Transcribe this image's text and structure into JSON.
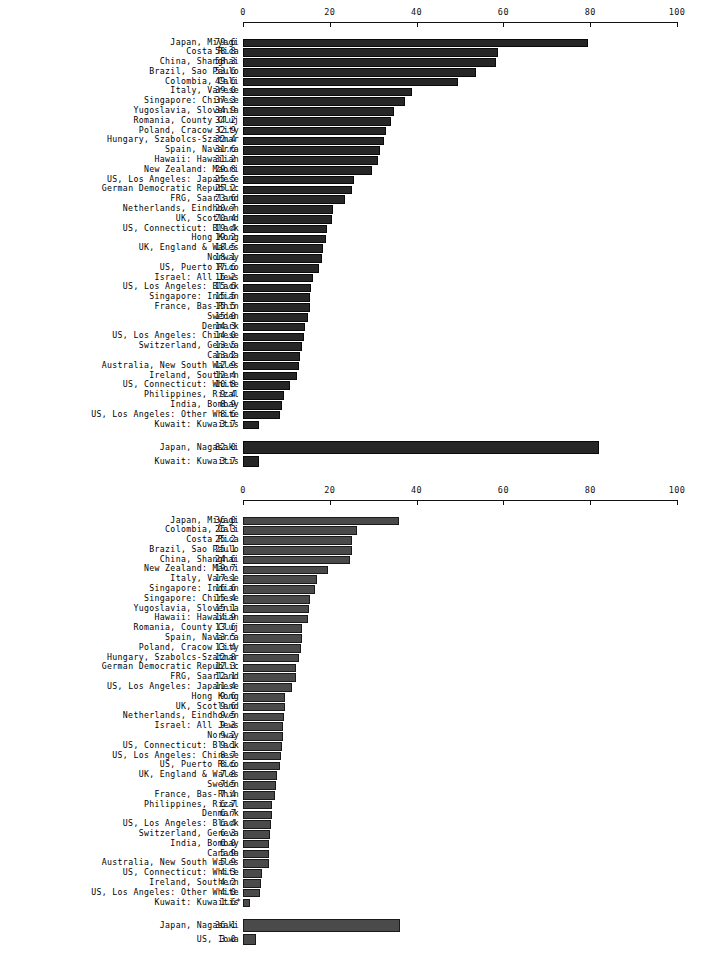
{
  "chart_data": [
    {
      "id": "chart-upper",
      "type": "bar",
      "orientation": "horizontal",
      "title": "",
      "xlabel": "",
      "ylabel": "",
      "xlim": [
        0,
        100
      ],
      "xticks": [
        0,
        20,
        40,
        60,
        80,
        100
      ],
      "xtick_labels": [
        "0",
        "20",
        "40",
        "60",
        "80",
        "100"
      ],
      "grid": false,
      "legend": "none",
      "bar_color": "#262626",
      "categories": [
        "Japan, Miyagi",
        "Costa Rica",
        "China, Shanghai",
        "Brazil, Sao Paulo",
        "Colombia, Cali",
        "Italy, Varese",
        "Singapore: Chinese",
        "Yugoslavia, Slovenia",
        "Romania, County Cluj",
        "Poland, Cracow City",
        "Hungary, Szabolcs-Szatmar",
        "Spain, Navarra",
        "Hawaii: Hawaiian",
        "New Zealand: Maori",
        "US, Los Angeles: Japanese",
        "German Democratic Republic",
        "FRG, Saarland",
        "Netherlands, Eindhoven",
        "UK, Scotland",
        "US, Connecticut: Black",
        "Hong Kong",
        "UK, England & Wales",
        "Norway",
        "US, Puerto Rico",
        "Israel: All Jews",
        "US, Los Angeles: Black",
        "Singapore: Indian",
        "France, Bas-Rhin",
        "Sweden",
        "Denmark",
        "US, Los Angeles: Chinese",
        "Switzerland, Geneva",
        "Canada",
        "Australia, New South Wales",
        "Ireland, Southern",
        "US, Connecticut: White",
        "Philippines, Rizal",
        "India, Bombay",
        "US, Los Angeles: Other White",
        "Kuwait: Kuwaitis"
      ],
      "values": [
        79.6,
        58.8,
        58.3,
        53.6,
        49.6,
        39.0,
        37.3,
        34.9,
        34.2,
        32.9,
        32.4,
        31.6,
        31.2,
        29.8,
        25.5,
        25.2,
        23.6,
        20.7,
        20.4,
        19.4,
        19.2,
        18.5,
        18.1,
        17.6,
        16.2,
        15.6,
        15.5,
        15.5,
        15.0,
        14.3,
        14.0,
        13.5,
        13.2,
        12.9,
        12.4,
        10.8,
        9.4,
        8.9,
        8.6,
        3.7
      ],
      "value_labels": [
        "79.6",
        "58.8",
        "58.3",
        "53.6",
        "49.6",
        "39.0",
        "37.3",
        "34.9",
        "34.2",
        "32.9",
        "32.4",
        "31.6",
        "31.2",
        "29.8",
        "25.5",
        "25.2",
        "23.6",
        "20.7",
        "20.4",
        "19.4",
        "19.2",
        "18.5",
        "18.1",
        "17.6",
        "16.2",
        "15.6",
        "15.5",
        "15.5",
        "15.0",
        "14.3",
        "14.0",
        "13.5",
        "13.2",
        "12.9",
        "12.4",
        "10.8",
        "9.4",
        "8.9",
        "8.6",
        "3.7"
      ],
      "notes": [
        "",
        "",
        "",
        "",
        "",
        "",
        "",
        "",
        "",
        "",
        "",
        "",
        "",
        "",
        "",
        "",
        "",
        "",
        "",
        "",
        "",
        "",
        "",
        "",
        "",
        "",
        "",
        "",
        "",
        "",
        "",
        "",
        "",
        "",
        "",
        "",
        "",
        "",
        "",
        ""
      ],
      "extremes": {
        "categories": [
          "Japan, Nagasaki",
          "Kuwait: Kuwaitis"
        ],
        "values": [
          82.0,
          3.7
        ],
        "value_labels": [
          "82.0",
          "3.7"
        ],
        "notes": [
          "",
          ""
        ],
        "emphasis": [
          "tall",
          "short-extra"
        ]
      }
    },
    {
      "id": "chart-lower",
      "type": "bar",
      "orientation": "horizontal",
      "title": "",
      "xlabel": "",
      "ylabel": "",
      "xlim": [
        0,
        100
      ],
      "xticks": [
        0,
        20,
        40,
        60,
        80,
        100
      ],
      "xtick_labels": [
        "0",
        "20",
        "40",
        "60",
        "80",
        "100"
      ],
      "grid": false,
      "legend": "none",
      "bar_color": "#4a4a4a",
      "categories": [
        "Japan, Miyagi",
        "Colombia, Cali",
        "Costa Rica",
        "Brazil, Sao Paulo",
        "China, Shanghai",
        "New Zealand: Maori",
        "Italy, Varese",
        "Singapore: Indian",
        "Singapore: Chinese",
        "Yugoslavia, Slovenia",
        "Hawaii: Hawaiian",
        "Romania, County Cluj",
        "Spain, Navarra",
        "Poland, Cracow City",
        "Hungary, Szabolcs-Szatmar",
        "German Democratic Republic",
        "FRG, Saarland",
        "US, Los Angeles: Japanese",
        "Hong Kong",
        "UK, Scotland",
        "Netherlands, Eindhoven",
        "Israel: All Jews",
        "Norway",
        "US, Connecticut: Black",
        "US, Los Angeles: Chinese",
        "US, Puerto Rico",
        "UK, England & Wales",
        "Sweden",
        "France, Bas-Rhin",
        "Philippines, Rizal",
        "Denmark",
        "US, Los Angeles: Black",
        "Switzerland, Geneva",
        "India, Bombay",
        "Canada",
        "Australia, New South Wales",
        "US, Connecticut: White",
        "Ireland, Southern",
        "US, Los Angeles: Other White",
        "Kuwait: Kuwaitis"
      ],
      "values": [
        36.0,
        26.3,
        25.2,
        25.1,
        24.6,
        19.7,
        17.1,
        16.6,
        15.4,
        15.1,
        14.9,
        13.6,
        13.5,
        13.4,
        12.8,
        12.3,
        12.1,
        11.4,
        9.6,
        9.6,
        9.5,
        9.3,
        9.2,
        9.1,
        8.7,
        8.6,
        7.8,
        7.5,
        7.4,
        6.7,
        6.7,
        6.4,
        6.3,
        6.0,
        5.9,
        5.9,
        4.3,
        4.2,
        4.0,
        1.6
      ],
      "value_labels": [
        "36.0",
        "26.3",
        "25.2",
        "25.1",
        "24.6",
        "19.7",
        "17.1",
        "16.6",
        "15.4",
        "15.1",
        "14.9",
        "13.6",
        "13.5",
        "13.4",
        "12.8",
        "12.3",
        "12.1",
        "11.4",
        "9.6",
        "9.6",
        "9.5",
        "9.3",
        "9.2",
        "9.1",
        "8.7",
        "8.6",
        "7.8",
        "7.5",
        "7.4",
        "6.7",
        "6.7",
        "6.4",
        "6.3",
        "6.0",
        "5.9",
        "5.9",
        "4.3",
        "4.2",
        "4.0",
        "1.6"
      ],
      "notes": [
        "",
        "",
        "",
        "",
        "",
        "",
        "",
        "",
        "",
        "",
        "",
        "",
        "",
        "",
        "",
        "",
        "",
        "",
        "",
        "",
        "",
        "",
        "",
        "",
        "",
        "",
        "",
        "",
        "",
        "",
        "",
        "",
        "",
        "",
        "",
        "",
        "",
        "",
        "",
        "*"
      ],
      "extremes": {
        "categories": [
          "Japan, Nagasaki",
          "US, Iowa"
        ],
        "values": [
          36.1,
          3.0
        ],
        "value_labels": [
          "36.1",
          "3.0"
        ],
        "notes": [
          "",
          ""
        ],
        "emphasis": [
          "tall",
          "short-extra"
        ]
      }
    }
  ]
}
